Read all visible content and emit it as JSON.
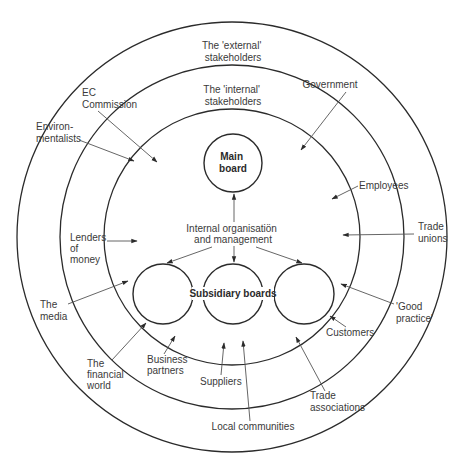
{
  "diagram": {
    "colors": {
      "line": "#2b2b2b",
      "text": "#3a3a3a",
      "background": "#ffffff"
    },
    "rings": [
      {
        "id": "outer",
        "label_line1": "The 'external'",
        "label_line2": "stakeholders",
        "cx": 232,
        "cy": 237,
        "r": 215
      },
      {
        "id": "middle",
        "label_line1": "The 'internal'",
        "label_line2": "stakeholders",
        "cx": 232,
        "cy": 237,
        "r": 172
      },
      {
        "id": "inner",
        "cx": 232,
        "cy": 237,
        "r": 128
      }
    ],
    "main_board": {
      "line1": "Main",
      "line2": "board",
      "cx": 233,
      "cy": 163,
      "r": 29
    },
    "internal_org": {
      "line1": "Internal organisatiön",
      "line2": "and management"
    },
    "subsidiary": {
      "label": "Subsidiary boards",
      "circles": [
        {
          "cx": 163,
          "cy": 294,
          "r": 30
        },
        {
          "cx": 233,
          "cy": 294,
          "r": 30
        },
        {
          "cx": 304,
          "cy": 294,
          "r": 30
        }
      ]
    },
    "stakeholders": {
      "ec_commission": {
        "line1": "EC",
        "line2": "Commission"
      },
      "government": {
        "line1": "Government"
      },
      "environmentalists": {
        "line1": "Environ-",
        "line2": "mentalists"
      },
      "employees": {
        "line1": "Employees"
      },
      "lenders": {
        "line1": "Lenders",
        "line2": "of",
        "line3": "money"
      },
      "trade_unions": {
        "line1": "Trade",
        "line2": "unions"
      },
      "media": {
        "line1": "The",
        "line2": "media"
      },
      "good_practice": {
        "line1": "'Good",
        "line2": "practice'"
      },
      "customers": {
        "line1": "Customers"
      },
      "financial_world": {
        "line1": "The",
        "line2": "financial",
        "line3": "world"
      },
      "business_partners": {
        "line1": "Business",
        "line2": "partners"
      },
      "suppliers": {
        "line1": "Suppliers"
      },
      "trade_associations": {
        "line1": "Trade",
        "line2": "associations"
      },
      "local_communities": {
        "line1": "Local communities"
      }
    }
  }
}
